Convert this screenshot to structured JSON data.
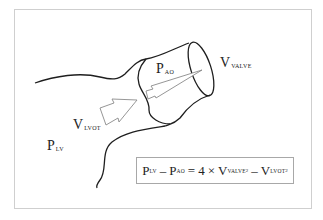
{
  "diagram": {
    "labels": {
      "p_ao": {
        "main": "P",
        "sub": "AO"
      },
      "v_valve": {
        "main": "V",
        "sub": "VALVE"
      },
      "v_lvot": {
        "main": "V",
        "sub": "LVOT"
      },
      "p_lv": {
        "main": "P",
        "sub": "LV"
      }
    },
    "formula": {
      "lhs1": {
        "main": "P",
        "sub": "LV"
      },
      "minus1": "–",
      "lhs2": {
        "main": "P",
        "sub": "AO"
      },
      "equals": "=",
      "coef": "4",
      "times": "×",
      "rhs1": {
        "main": "V",
        "sub": "VALVE",
        "sup": "2"
      },
      "minus2": "–",
      "rhs2": {
        "main": "V",
        "sub": "LVOT",
        "sup": "2"
      }
    },
    "colors": {
      "wall": "#1e1e1e",
      "arrow": "#8a8a8a",
      "frame": "#cfcfcf",
      "formula_border": "#a8a8a8"
    }
  }
}
